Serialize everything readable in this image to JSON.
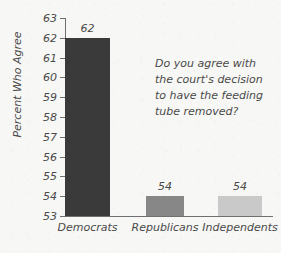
{
  "chart_data": {
    "type": "bar",
    "title": "",
    "subtitle": "",
    "xlabel": "",
    "ylabel": "Percent Who Agree",
    "ylim": [
      53,
      63
    ],
    "yticks": [
      53,
      54,
      55,
      56,
      57,
      58,
      59,
      60,
      61,
      62,
      63
    ],
    "grid": false,
    "legend": "none",
    "categories": [
      "Democrats",
      "Republicans",
      "Independents"
    ],
    "values": [
      62,
      54,
      54
    ],
    "value_labels": [
      "62",
      "54",
      "54"
    ],
    "bar_colors": [
      "#3a3a3a",
      "#878787",
      "#c9c9c9"
    ],
    "annotations": [
      {
        "name": "survey-question",
        "lines": [
          "Do you agree with",
          "the court's decision",
          "to have the feeding",
          "tube removed?"
        ]
      }
    ],
    "background_color": "#f7f7f5",
    "axis_color": "#6f6f6f",
    "text_color": "#4a4a4a"
  }
}
